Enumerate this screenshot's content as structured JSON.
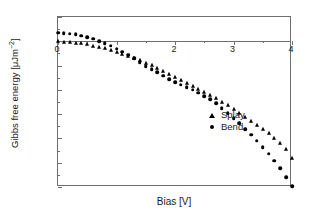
{
  "chart_data": {
    "type": "scatter",
    "title": "",
    "xlabel": "Bias [V]",
    "ylabel_main": "Gibbs free energy [μJm",
    "ylabel_exp": "−2",
    "ylabel_tail": "]",
    "ylabel_full": "Gibbs free energy [μJm−2]",
    "xlim": [
      0,
      4
    ],
    "ylim": [
      -120,
      20
    ],
    "xticks": [
      0,
      1,
      2,
      3,
      4
    ],
    "xticklabels": [
      "0",
      "1",
      "2",
      "3",
      "4"
    ],
    "xticklabels_visible": [
      "0",
      "",
      "2",
      "3",
      "4"
    ],
    "yticks": [
      20,
      0,
      -20,
      -40,
      -60,
      -80,
      -100,
      -120
    ],
    "yticklabels": [
      "20",
      "0",
      "−20",
      "−40",
      "−60",
      "−80",
      "−100",
      "−120"
    ],
    "grid": false,
    "legend_position": "center-left-inside",
    "zero_line": 0,
    "series": [
      {
        "name": "Splay",
        "marker": "triangle",
        "color": "#000000",
        "x": [
          0.0,
          0.1,
          0.2,
          0.3,
          0.4,
          0.5,
          0.6,
          0.7,
          0.8,
          0.9,
          1.0,
          1.1,
          1.2,
          1.3,
          1.4,
          1.5,
          1.6,
          1.7,
          1.8,
          1.9,
          2.0,
          2.1,
          2.2,
          2.3,
          2.4,
          2.5,
          2.6,
          2.7,
          2.8,
          2.9,
          3.0,
          3.1,
          3.2,
          3.3,
          3.4,
          3.5,
          3.6,
          3.7,
          3.8,
          3.9,
          4.0
        ],
        "y": [
          0.0,
          -0.2,
          -0.5,
          -1.0,
          -1.7,
          -2.5,
          -3.5,
          -4.6,
          -5.9,
          -7.3,
          -8.8,
          -10.4,
          -12.1,
          -13.9,
          -15.8,
          -17.8,
          -19.9,
          -22.1,
          -24.4,
          -26.8,
          -29.3,
          -31.6,
          -34.0,
          -36.5,
          -39.0,
          -41.6,
          -44.2,
          -47.0,
          -49.8,
          -52.7,
          -55.7,
          -58.8,
          -62.0,
          -65.3,
          -68.7,
          -72.2,
          -75.8,
          -79.5,
          -83.5,
          -89.0,
          -96.0
        ]
      },
      {
        "name": "Bend",
        "marker": "circle",
        "color": "#000000",
        "x": [
          0.0,
          0.1,
          0.2,
          0.3,
          0.4,
          0.5,
          0.6,
          0.7,
          0.8,
          0.9,
          1.0,
          1.1,
          1.2,
          1.3,
          1.4,
          1.5,
          1.6,
          1.7,
          1.8,
          1.9,
          2.0,
          2.1,
          2.2,
          2.3,
          2.4,
          2.5,
          2.6,
          2.7,
          2.8,
          2.9,
          3.0,
          3.1,
          3.2,
          3.3,
          3.4,
          3.5,
          3.6,
          3.7,
          3.8,
          3.9,
          4.0
        ],
        "y": [
          7.0,
          6.8,
          6.3,
          5.6,
          4.6,
          3.4,
          2.0,
          0.3,
          -1.6,
          -3.7,
          -6.0,
          -8.5,
          -11.2,
          -14.1,
          -17.2,
          -20.4,
          -23.0,
          -25.6,
          -28.4,
          -31.3,
          -33.5,
          -35.6,
          -37.8,
          -40.0,
          -42.4,
          -45.0,
          -47.8,
          -51.2,
          -55.0,
          -59.0,
          -63.2,
          -67.6,
          -72.2,
          -77.0,
          -82.0,
          -87.2,
          -92.6,
          -98.2,
          -104.5,
          -112.0,
          -119.5
        ]
      }
    ],
    "legend": [
      {
        "label": "Splay",
        "marker": "triangle"
      },
      {
        "label": "Bend",
        "marker": "circle"
      }
    ]
  }
}
